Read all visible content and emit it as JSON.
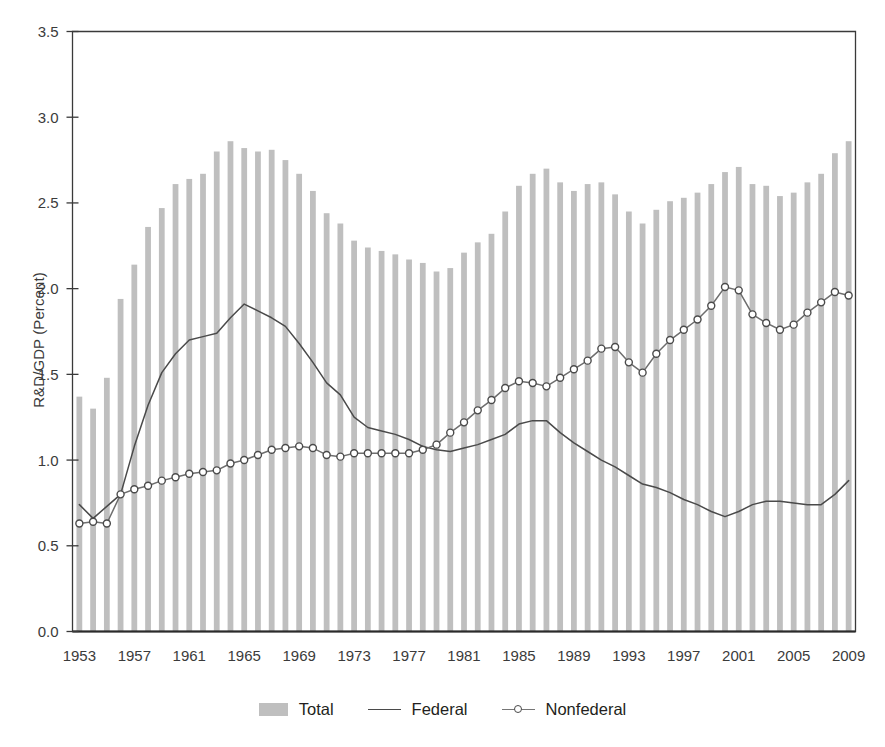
{
  "chart_data": {
    "type": "bar",
    "title": "",
    "subtitle": "",
    "xlabel": "",
    "ylabel": "R&D/GDP (Percent)",
    "ylim": [
      0.0,
      3.5
    ],
    "ytick_step": 0.5,
    "ytick_labels": [
      "0.0",
      "0.5",
      "1.0",
      "1.5",
      "2.0",
      "2.5",
      "3.0",
      "3.5"
    ],
    "xlim": [
      1953,
      2009
    ],
    "xtick_step": 4,
    "xtick_labels": [
      "1953",
      "1957",
      "1961",
      "1965",
      "1969",
      "1973",
      "1977",
      "1981",
      "1985",
      "1989",
      "1993",
      "1997",
      "2001",
      "2005",
      "2009"
    ],
    "grid": false,
    "legend_position": "bottom-center",
    "categories": [
      1953,
      1954,
      1955,
      1956,
      1957,
      1958,
      1959,
      1960,
      1961,
      1962,
      1963,
      1964,
      1965,
      1966,
      1967,
      1968,
      1969,
      1970,
      1971,
      1972,
      1973,
      1974,
      1975,
      1976,
      1977,
      1978,
      1979,
      1980,
      1981,
      1982,
      1983,
      1984,
      1985,
      1986,
      1987,
      1988,
      1989,
      1990,
      1991,
      1992,
      1993,
      1994,
      1995,
      1996,
      1997,
      1998,
      1999,
      2000,
      2001,
      2002,
      2003,
      2004,
      2005,
      2006,
      2007,
      2008,
      2009
    ],
    "series": [
      {
        "name": "Total",
        "kind": "bar",
        "color": "#bfbfbf",
        "values": [
          1.37,
          1.3,
          1.48,
          1.94,
          2.14,
          2.36,
          2.47,
          2.61,
          2.64,
          2.67,
          2.8,
          2.86,
          2.82,
          2.8,
          2.81,
          2.75,
          2.67,
          2.57,
          2.44,
          2.38,
          2.28,
          2.24,
          2.22,
          2.2,
          2.17,
          2.15,
          2.1,
          2.12,
          2.21,
          2.27,
          2.32,
          2.45,
          2.6,
          2.67,
          2.7,
          2.62,
          2.57,
          2.61,
          2.62,
          2.55,
          2.45,
          2.38,
          2.46,
          2.51,
          2.53,
          2.56,
          2.61,
          2.68,
          2.71,
          2.61,
          2.6,
          2.54,
          2.56,
          2.62,
          2.67,
          2.79,
          2.86
        ]
      },
      {
        "name": "Federal",
        "kind": "line",
        "color": "#4a4a4a",
        "values": [
          0.74,
          0.66,
          0.73,
          0.8,
          1.08,
          1.32,
          1.51,
          1.62,
          1.7,
          1.72,
          1.74,
          1.83,
          1.91,
          1.87,
          1.83,
          1.78,
          1.68,
          1.57,
          1.45,
          1.38,
          1.25,
          1.19,
          1.17,
          1.15,
          1.12,
          1.08,
          1.06,
          1.05,
          1.07,
          1.09,
          1.12,
          1.15,
          1.21,
          1.23,
          1.23,
          1.16,
          1.1,
          1.05,
          1.0,
          0.96,
          0.91,
          0.86,
          0.84,
          0.81,
          0.77,
          0.74,
          0.7,
          0.67,
          0.7,
          0.74,
          0.76,
          0.76,
          0.75,
          0.74,
          0.74,
          0.8,
          0.88
        ]
      },
      {
        "name": "Nonfederal",
        "kind": "line-marker",
        "color": "#6e6e6e",
        "marker": "open-circle",
        "values": [
          0.63,
          0.64,
          0.63,
          0.8,
          0.83,
          0.85,
          0.88,
          0.9,
          0.92,
          0.93,
          0.94,
          0.98,
          1.0,
          1.03,
          1.06,
          1.07,
          1.08,
          1.07,
          1.03,
          1.02,
          1.04,
          1.04,
          1.04,
          1.04,
          1.04,
          1.06,
          1.09,
          1.16,
          1.22,
          1.29,
          1.35,
          1.42,
          1.46,
          1.45,
          1.43,
          1.48,
          1.53,
          1.58,
          1.65,
          1.66,
          1.57,
          1.51,
          1.62,
          1.7,
          1.76,
          1.82,
          1.9,
          2.01,
          1.99,
          1.85,
          1.8,
          1.76,
          1.79,
          1.86,
          1.92,
          1.98,
          1.96
        ]
      }
    ]
  },
  "legend": {
    "entries": [
      {
        "label": "Total",
        "style": "bar"
      },
      {
        "label": "Federal",
        "style": "line"
      },
      {
        "label": "Nonfederal",
        "style": "line-marker"
      }
    ]
  },
  "axis": {
    "y_title": "R&D/GDP (Percent)"
  }
}
